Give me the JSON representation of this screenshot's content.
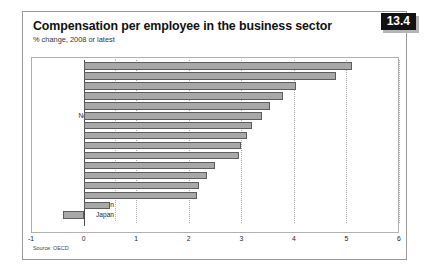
{
  "figure": {
    "badge": "13.4",
    "title": "Compensation per employee in the business sector",
    "subtitle": "% change, 2008 or latest",
    "source": "Source: OECD"
  },
  "chart_data": {
    "type": "bar",
    "orientation": "horizontal",
    "title": "Compensation per employee in the business sector",
    "subtitle": "% change, 2008 or latest",
    "xlabel": "",
    "ylabel": "",
    "xlim": [
      -1,
      6
    ],
    "xticks": [
      "-1",
      "0",
      "1",
      "2",
      "3",
      "4",
      "5",
      "6"
    ],
    "xtick_values": [
      -1,
      0,
      1,
      2,
      3,
      4,
      5,
      6
    ],
    "grid": true,
    "grid_axis": "x",
    "legend": false,
    "bar_fill_color": "#a8a8a8",
    "bar_edge_color": "#5d5d5d",
    "categories": [
      "Spain",
      "Denmark",
      "Canada",
      "Australia",
      "OECD",
      "Netherlands",
      "US",
      "Austria",
      "Euro area",
      "UK",
      "Belgium",
      "France",
      "Italy",
      "Germany",
      "Sweden",
      "Japan"
    ],
    "values": [
      5.1,
      4.8,
      4.05,
      3.8,
      3.55,
      3.4,
      3.2,
      3.1,
      3.0,
      2.95,
      2.5,
      2.35,
      2.2,
      2.15,
      0.5,
      -0.4
    ]
  }
}
